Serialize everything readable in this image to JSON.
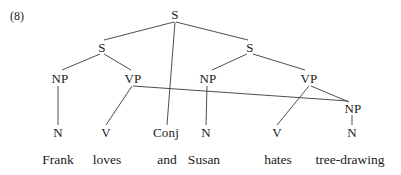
{
  "figure": {
    "example_number": "(8)",
    "background_color": "#ffffff",
    "line_color": "#3a3a3a",
    "text_color": "#1a1a1a"
  },
  "chart_data": {
    "type": "diagram",
    "subtype": "syntax-tree",
    "title": "(8)",
    "sentence": "Frank loves and Susan hates tree-drawing",
    "nodes": [
      {
        "id": "S0",
        "label": "S",
        "x": 175,
        "y": 14,
        "level": 0
      },
      {
        "id": "S1",
        "label": "S",
        "x": 102,
        "y": 47,
        "level": 1
      },
      {
        "id": "S2",
        "label": "S",
        "x": 250,
        "y": 47,
        "level": 1
      },
      {
        "id": "NP1",
        "label": "NP",
        "x": 60,
        "y": 78,
        "level": 2
      },
      {
        "id": "VP1",
        "label": "VP",
        "x": 133,
        "y": 78,
        "level": 2
      },
      {
        "id": "NP2",
        "label": "NP",
        "x": 208,
        "y": 78,
        "level": 2
      },
      {
        "id": "VP2",
        "label": "VP",
        "x": 309,
        "y": 78,
        "level": 2
      },
      {
        "id": "NP3",
        "label": "NP",
        "x": 353,
        "y": 108,
        "level": 3
      },
      {
        "id": "N1",
        "label": "N",
        "x": 58,
        "y": 132,
        "level": 4
      },
      {
        "id": "V1",
        "label": "V",
        "x": 106,
        "y": 132,
        "level": 4
      },
      {
        "id": "CONJ",
        "label": "Conj",
        "x": 166,
        "y": 132,
        "level": 4
      },
      {
        "id": "N2",
        "label": "N",
        "x": 206,
        "y": 132,
        "level": 4
      },
      {
        "id": "V2",
        "label": "V",
        "x": 277,
        "y": 132,
        "level": 4
      },
      {
        "id": "N3",
        "label": "N",
        "x": 352,
        "y": 132,
        "level": 4
      }
    ],
    "edges": [
      {
        "from": "S0",
        "to": "S1",
        "x1": 174,
        "y1": 22,
        "x2": 104,
        "y2": 40
      },
      {
        "from": "S0",
        "to": "CONJ",
        "x1": 175,
        "y1": 22,
        "x2": 167,
        "y2": 125
      },
      {
        "from": "S0",
        "to": "S2",
        "x1": 176,
        "y1": 22,
        "x2": 248,
        "y2": 40
      },
      {
        "from": "S1",
        "to": "NP1",
        "x1": 100,
        "y1": 54,
        "x2": 62,
        "y2": 70
      },
      {
        "from": "S1",
        "to": "VP1",
        "x1": 104,
        "y1": 54,
        "x2": 131,
        "y2": 70
      },
      {
        "from": "S2",
        "to": "NP2",
        "x1": 247,
        "y1": 54,
        "x2": 212,
        "y2": 70
      },
      {
        "from": "S2",
        "to": "VP2",
        "x1": 253,
        "y1": 54,
        "x2": 305,
        "y2": 70
      },
      {
        "from": "NP1",
        "to": "N1",
        "x1": 58,
        "y1": 86,
        "x2": 58,
        "y2": 125
      },
      {
        "from": "VP1",
        "to": "V1",
        "x1": 132,
        "y1": 86,
        "x2": 106,
        "y2": 125
      },
      {
        "from": "VP1",
        "to": "NP3",
        "x1": 133,
        "y1": 86,
        "x2": 348,
        "y2": 101
      },
      {
        "from": "NP2",
        "to": "N2",
        "x1": 207,
        "y1": 86,
        "x2": 206,
        "y2": 125
      },
      {
        "from": "VP2",
        "to": "V2",
        "x1": 309,
        "y1": 86,
        "x2": 277,
        "y2": 125
      },
      {
        "from": "VP2",
        "to": "NP3",
        "x1": 311,
        "y1": 86,
        "x2": 349,
        "y2": 102
      },
      {
        "from": "NP3",
        "to": "N3",
        "x1": 352,
        "y1": 115,
        "x2": 352,
        "y2": 125
      }
    ],
    "words": [
      {
        "id": "W1",
        "label": "Frank",
        "x": 58,
        "y": 160
      },
      {
        "id": "W2",
        "label": "loves",
        "x": 107,
        "y": 160
      },
      {
        "id": "W3",
        "label": "and",
        "x": 167,
        "y": 160
      },
      {
        "id": "W4",
        "label": "Susan",
        "x": 204,
        "y": 160
      },
      {
        "id": "W5",
        "label": "hates",
        "x": 278,
        "y": 160
      },
      {
        "id": "W6",
        "label": "tree-drawing",
        "x": 350,
        "y": 160
      }
    ]
  }
}
